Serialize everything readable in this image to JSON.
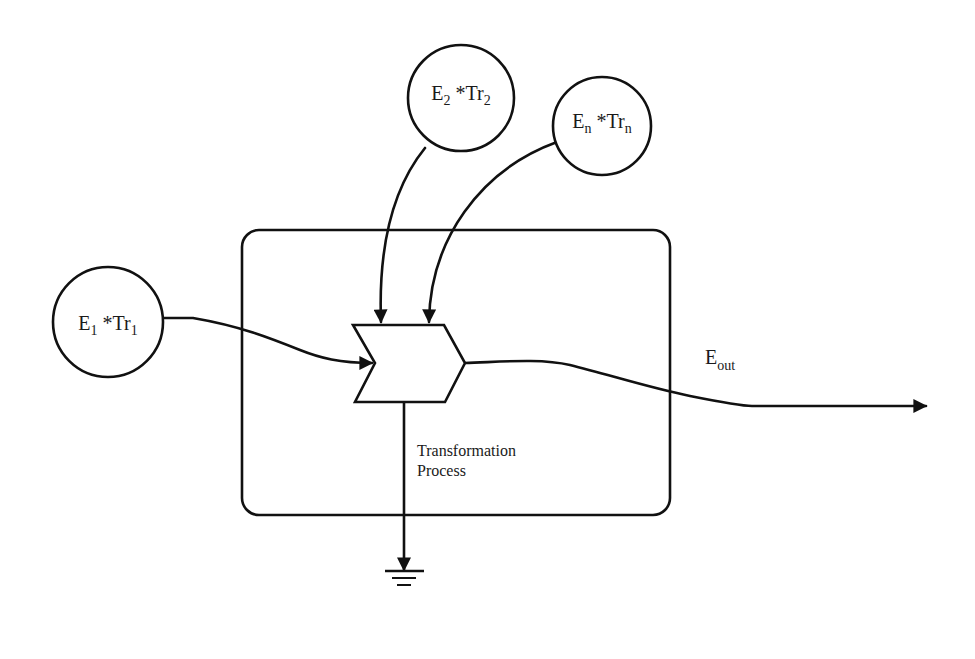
{
  "diagram": {
    "colors": {
      "line": "#111111",
      "background": "#ffffff",
      "text": "#1a1a1a"
    },
    "inputs": [
      {
        "id": "e1",
        "base": "E",
        "base_sub": "1",
        "op": " *Tr",
        "op_sub": "1"
      },
      {
        "id": "e2",
        "base": "E",
        "base_sub": "2",
        "op": " *Tr",
        "op_sub": "2"
      },
      {
        "id": "en",
        "base": "E",
        "base_sub": "n",
        "op": " *Tr",
        "op_sub": "n"
      }
    ],
    "process": {
      "label_line1": "Transformation",
      "label_line2": "Process"
    },
    "output": {
      "base": "E",
      "sub": "out"
    },
    "sink": {
      "icon": "ground-icon"
    }
  }
}
